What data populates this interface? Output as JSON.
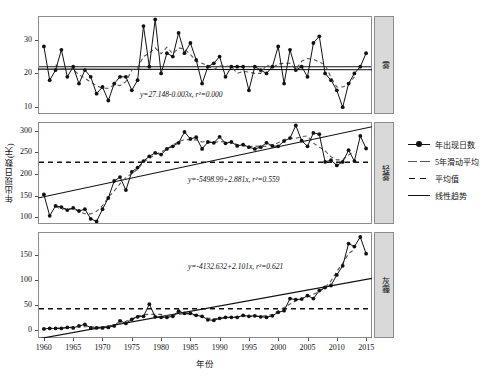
{
  "chart_data": {
    "type": "line",
    "title": "",
    "xlabel": "年份",
    "ylabel": "年出现日数(天)",
    "xlim": [
      1959,
      2016
    ],
    "xticks": [
      1960,
      1965,
      1970,
      1975,
      1980,
      1985,
      1990,
      1995,
      2000,
      2005,
      2010,
      2015
    ],
    "grid": false,
    "legend_position": "right",
    "legend": [
      {
        "label": "年出现日数",
        "style": "solid-line-with-dots",
        "color": "#111111"
      },
      {
        "label": "5年滑动平均",
        "style": "long-dashed",
        "color": "#555555"
      },
      {
        "label": "平均值",
        "style": "short-dashed",
        "color": "#111111"
      },
      {
        "label": "线性趋势",
        "style": "solid",
        "color": "#111111"
      }
    ],
    "x": [
      1960,
      1961,
      1962,
      1963,
      1964,
      1965,
      1966,
      1967,
      1968,
      1969,
      1970,
      1971,
      1972,
      1973,
      1974,
      1975,
      1976,
      1977,
      1978,
      1979,
      1980,
      1981,
      1982,
      1983,
      1984,
      1985,
      1986,
      1987,
      1988,
      1989,
      1990,
      1991,
      1992,
      1993,
      1994,
      1995,
      1996,
      1997,
      1998,
      1999,
      2000,
      2001,
      2002,
      2003,
      2004,
      2005,
      2006,
      2007,
      2008,
      2009,
      2010,
      2011,
      2012,
      2013,
      2014,
      2015
    ],
    "panels": [
      {
        "name": "雾",
        "ylim": [
          8,
          37
        ],
        "yticks": [
          10,
          20,
          30
        ],
        "equation": "y=27.148-0.003x, r²=0.000",
        "equation_parts": {
          "intercept": 27.148,
          "slope": -0.003,
          "r2": 0.0
        },
        "mean": 22.0,
        "values": [
          28,
          18,
          21,
          27,
          19,
          22,
          17,
          21,
          19,
          14,
          16,
          12,
          17,
          19,
          19,
          15,
          18,
          34,
          22,
          36,
          20,
          26,
          25,
          32,
          26,
          29,
          24,
          17,
          22,
          23,
          25,
          19,
          22,
          22,
          22,
          15,
          22,
          21,
          20,
          22,
          28,
          17,
          27,
          21,
          22,
          19,
          29,
          31,
          20,
          18,
          15,
          10,
          17,
          20,
          22,
          26
        ]
      },
      {
        "name": "轻雾",
        "ylim": [
          85,
          320
        ],
        "yticks": [
          100,
          150,
          200,
          250,
          300
        ],
        "equation": "y=-5498.99+2.881x, r²=0.559",
        "equation_parts": {
          "intercept": -5498.99,
          "slope": 2.881,
          "r2": 0.559
        },
        "mean": 227,
        "values": [
          153,
          104,
          127,
          124,
          117,
          122,
          115,
          119,
          97,
          91,
          119,
          145,
          184,
          193,
          163,
          205,
          215,
          230,
          241,
          249,
          245,
          258,
          264,
          272,
          297,
          281,
          285,
          258,
          274,
          272,
          286,
          271,
          274,
          265,
          268,
          262,
          258,
          262,
          272,
          265,
          264,
          276,
          283,
          312,
          277,
          264,
          295,
          292,
          228,
          232,
          220,
          228,
          255,
          230,
          288,
          259
        ]
      },
      {
        "name": "灰霾",
        "ylim": [
          -15,
          195
        ],
        "yticks": [
          0,
          50,
          100,
          150
        ],
        "equation": "y=-4132.632+2.101x, r²=0.621",
        "equation_parts": {
          "intercept": -4132.632,
          "slope": 2.101,
          "r2": 0.621
        },
        "mean": 43,
        "values": [
          3,
          4,
          4,
          4,
          6,
          5,
          9,
          12,
          5,
          5,
          5,
          6,
          9,
          19,
          14,
          22,
          27,
          28,
          52,
          27,
          26,
          26,
          28,
          38,
          34,
          34,
          30,
          28,
          21,
          20,
          24,
          26,
          26,
          26,
          30,
          28,
          29,
          27,
          26,
          29,
          36,
          39,
          63,
          61,
          62,
          69,
          63,
          79,
          85,
          89,
          110,
          128,
          172,
          166,
          185,
          152
        ]
      }
    ]
  }
}
